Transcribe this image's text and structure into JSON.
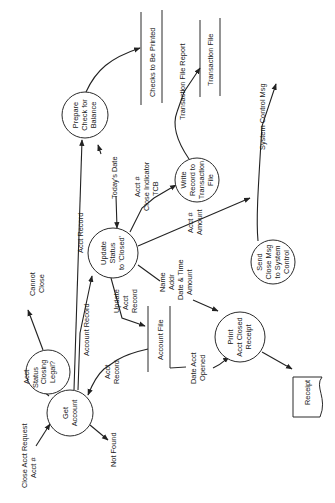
{
  "diagram": {
    "type": "data-flow-diagram",
    "orientation": "rotated-90-ccw",
    "processes": {
      "get_account": [
        "Get",
        "Account"
      ],
      "closing_legal": [
        "Closing",
        "Legal?"
      ],
      "update_status": [
        "Update",
        "Status",
        "to 'Closed'"
      ],
      "prepare_check": [
        "Prepare",
        "Check for",
        "Balance"
      ],
      "write_record": [
        "Write",
        "Record to",
        "Transaction",
        "File"
      ],
      "send_close_msg": [
        "Send",
        "Close Msg",
        "to System",
        "Control"
      ],
      "print_receipt": [
        "Print",
        "Acct Closed",
        "Receipt"
      ]
    },
    "stores": {
      "checks_to_be_printed": "Checks to Be Printed",
      "transaction_file": "Transaction File",
      "account_file": "Account File"
    },
    "documents": {
      "receipt": "Receipt"
    },
    "flows": {
      "close_acct_request": [
        "Close Acct Request",
        "Acct #"
      ],
      "not_found": [
        "Not Found"
      ],
      "acct_status": [
        "Acct",
        "Status"
      ],
      "cannot_close": [
        "Cannot",
        "Close"
      ],
      "account_record": [
        "Account Record"
      ],
      "acct_record_long": [
        "Acct Record"
      ],
      "acct_record_from_file": [
        "Acct",
        "Record"
      ],
      "update_acct_record": [
        "Update",
        "Acct",
        "Record"
      ],
      "todays_date": [
        "Today's Date"
      ],
      "close_indicator": [
        "Acct #",
        "Close Indicator",
        "TCB"
      ],
      "acct_amount": [
        "Acct #",
        "Amount"
      ],
      "receipt_data": [
        "Name",
        "Addr",
        "Date & Time",
        "Amount"
      ],
      "date_acct_opened": [
        "Date Acct",
        "Opened"
      ],
      "transaction_file_report": [
        "Transaction File Report"
      ],
      "system_control_msg": [
        "System Control Msg"
      ]
    }
  }
}
